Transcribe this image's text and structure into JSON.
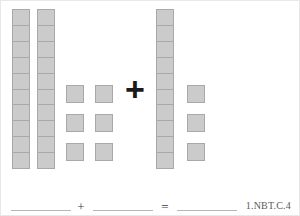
{
  "worksheet": {
    "type": "base-ten-blocks-addition",
    "problem": {
      "addend_left": {
        "rods": 2,
        "rod_cells": 10,
        "units": 6,
        "value": 26
      },
      "operator": "+",
      "addend_right": {
        "rods": 1,
        "rod_cells": 10,
        "units": 3,
        "value": 13
      }
    },
    "answer_row": {
      "blank_left": "",
      "operator_plus": "+",
      "blank_right": "",
      "operator_equals": "=",
      "blank_sum": ""
    },
    "standard_code": "1.NBT.C.4",
    "colors": {
      "block_fill": "#cbcbcb",
      "block_border": "#a9a9a9",
      "operator": "#1a1a1a",
      "line": "#b8b8b8",
      "code_text": "#5a5a5a",
      "page_background": "#ffffff"
    }
  }
}
